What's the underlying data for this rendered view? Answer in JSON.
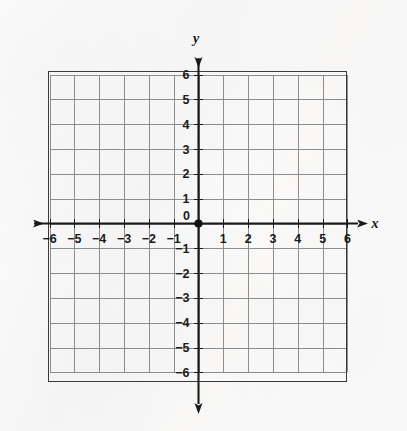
{
  "figure": {
    "kind": "cartesian-coordinate-plane",
    "background_color": "#fbfbfb",
    "grid_color": "#8d8d8d",
    "grid_border_color": "#3a3a3a",
    "axis_color": "#1a1a1a",
    "label_color": "#1a1a1a",
    "origin_dot_color": "#111111"
  },
  "chart_data": {
    "type": "scatter",
    "title": "",
    "subtitle": "",
    "xlabel": "x",
    "ylabel": "y",
    "xlim": [
      -6,
      6
    ],
    "ylim": [
      -6,
      6
    ],
    "xticks": [
      -6,
      -5,
      -4,
      -3,
      -2,
      -1,
      1,
      2,
      3,
      4,
      5,
      6
    ],
    "yticks": [
      -6,
      -5,
      -4,
      -3,
      -2,
      -1,
      1,
      2,
      3,
      4,
      5,
      6
    ],
    "xtick_labels": [
      "−6",
      "−5",
      "−4",
      "−3",
      "−2",
      "−1",
      "1",
      "2",
      "3",
      "4",
      "5",
      "6"
    ],
    "ytick_labels": [
      "−6",
      "−5",
      "−4",
      "−3",
      "−2",
      "−1",
      "1",
      "2",
      "3",
      "4",
      "5",
      "6"
    ],
    "origin_label": "0",
    "grid": true,
    "grid_step": 1,
    "legend": false,
    "legend_position": "none",
    "series": [
      {
        "name": "plotted points",
        "points": []
      }
    ],
    "annotations": [],
    "axis_arrows": [
      "left",
      "right",
      "up",
      "down"
    ],
    "origin_marker": {
      "x": 0,
      "y": 0,
      "style": "filled-dot",
      "visible": true
    }
  },
  "axis_labels": {
    "x_letter": "x",
    "y_letter": "y"
  }
}
